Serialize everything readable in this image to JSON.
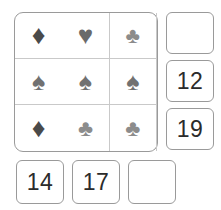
{
  "puzzle": {
    "type": "suit-matrix-puzzle",
    "grid": {
      "rows": 3,
      "columns": 3,
      "cells": [
        {
          "suit": "diamond",
          "symbol": "♦",
          "color": "#4a4a4a",
          "size": 27
        },
        {
          "suit": "heart",
          "symbol": "♥",
          "color": "#6a6a6a",
          "size": 26
        },
        {
          "suit": "club",
          "symbol": "♣",
          "color": "#8c8c8c",
          "size": 22
        },
        {
          "suit": "spade",
          "symbol": "♠",
          "color": "#717171",
          "size": 25
        },
        {
          "suit": "spade",
          "symbol": "♠",
          "color": "#717171",
          "size": 25
        },
        {
          "suit": "spade",
          "symbol": "♠",
          "color": "#717171",
          "size": 25
        },
        {
          "suit": "diamond",
          "symbol": "♦",
          "color": "#4a4a4a",
          "size": 27
        },
        {
          "suit": "club",
          "symbol": "♣",
          "color": "#8c8c8c",
          "size": 23
        },
        {
          "suit": "club",
          "symbol": "♣",
          "color": "#8c8c8c",
          "size": 23
        }
      ]
    },
    "right_options": [
      {
        "label": "",
        "empty": true
      },
      {
        "label": "12",
        "empty": false
      },
      {
        "label": "19",
        "empty": false
      }
    ],
    "bottom_options": [
      {
        "label": "14",
        "empty": false
      },
      {
        "label": "17",
        "empty": false
      },
      {
        "label": "",
        "empty": true
      }
    ],
    "colors": {
      "border": "#9a9a9a",
      "gridline": "#c9c9c9",
      "text": "#2b2b2b",
      "background": "#ffffff"
    }
  }
}
